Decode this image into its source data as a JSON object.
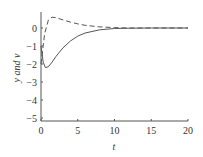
{
  "chart_data": {
    "type": "line",
    "title": "",
    "xlabel": "t",
    "ylabel": "y and v",
    "xlim": [
      0,
      20
    ],
    "ylim": [
      -5.3,
      1
    ],
    "xticks": [
      "0",
      "5",
      "10",
      "15",
      "20"
    ],
    "yticks": [
      "0",
      "-1",
      "-2",
      "-3",
      "-4",
      "-5"
    ],
    "grid": false,
    "legend": null,
    "series": [
      {
        "name": "y",
        "style": "solid",
        "x": [
          0,
          0.3,
          0.6,
          1,
          1.5,
          2,
          3,
          4,
          5,
          6,
          8,
          10,
          12,
          15,
          20
        ],
        "y": [
          -1.0,
          -1.9,
          -2.2,
          -2.15,
          -1.9,
          -1.6,
          -1.1,
          -0.72,
          -0.45,
          -0.28,
          -0.1,
          -0.03,
          -0.01,
          0,
          0
        ]
      },
      {
        "name": "v",
        "style": "dashed",
        "x": [
          0,
          0.5,
          1,
          1.5,
          2,
          3,
          4,
          5,
          6,
          8,
          10,
          12,
          15,
          20
        ],
        "y": [
          -2.0,
          -0.3,
          0.45,
          0.6,
          0.58,
          0.45,
          0.33,
          0.23,
          0.15,
          0.06,
          0.02,
          0,
          0,
          0
        ]
      }
    ]
  }
}
